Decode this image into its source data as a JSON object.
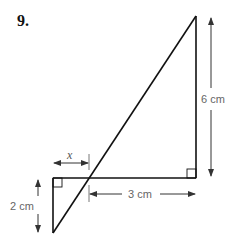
{
  "question": {
    "number": "9."
  },
  "diagram": {
    "labels": {
      "vertical_right": "6 cm",
      "vertical_left": "2 cm",
      "horizontal": "3 cm",
      "unknown": "x"
    },
    "colors": {
      "lines": "#111111",
      "dimensions": "#555555",
      "labels": "#666666"
    }
  }
}
